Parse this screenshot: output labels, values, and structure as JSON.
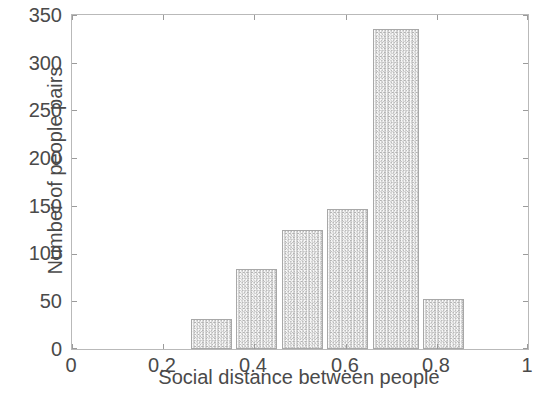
{
  "chart_data": {
    "type": "bar",
    "title": "",
    "subtitle": "",
    "xlabel": "Social distance between people",
    "ylabel": "Number of people pairs",
    "xlim": [
      0,
      1
    ],
    "ylim": [
      0,
      350
    ],
    "grid": false,
    "legend": null,
    "bin_width": 0.1,
    "bin_edges": [
      0.255,
      0.355,
      0.355,
      0.455,
      0.455,
      0.555,
      0.555,
      0.655,
      0.655,
      0.755,
      0.755,
      0.855
    ],
    "bars": [
      {
        "x_start": 0.26,
        "x_end": 0.35,
        "x_center": 0.305,
        "value": 31
      },
      {
        "x_start": 0.36,
        "x_end": 0.45,
        "x_center": 0.405,
        "value": 84
      },
      {
        "x_start": 0.46,
        "x_end": 0.55,
        "x_center": 0.505,
        "value": 125
      },
      {
        "x_start": 0.56,
        "x_end": 0.65,
        "x_center": 0.605,
        "value": 147
      },
      {
        "x_start": 0.66,
        "x_end": 0.76,
        "x_center": 0.71,
        "value": 335
      },
      {
        "x_start": 0.77,
        "x_end": 0.86,
        "x_center": 0.815,
        "value": 52
      }
    ],
    "categories": [
      "0.305",
      "0.405",
      "0.505",
      "0.605",
      "0.71",
      "0.815"
    ],
    "values": [
      31,
      84,
      125,
      147,
      335,
      52
    ],
    "xticks": [
      "0",
      "0.2",
      "0.4",
      "0.6",
      "0.8",
      "1"
    ],
    "xtick_values": [
      0,
      0.2,
      0.4,
      0.6,
      0.8,
      1
    ],
    "yticks": [
      "0",
      "50",
      "100",
      "150",
      "200",
      "250",
      "300",
      "350"
    ],
    "ytick_values": [
      0,
      50,
      100,
      150,
      200,
      250,
      300,
      350
    ],
    "colors": {
      "bar_fill": "#d4d4d4",
      "bar_edge": "#a8a8a8",
      "axis": "#b9b9b9",
      "text": "#4a4a4a",
      "background": "#ffffff"
    }
  }
}
